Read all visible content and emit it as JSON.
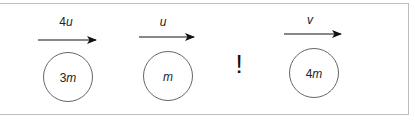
{
  "diagram": {
    "bodies": [
      {
        "mass_coeff": "3",
        "mass_var": "m",
        "velocity_coeff": "4",
        "velocity_var": "u"
      },
      {
        "mass_coeff": "",
        "mass_var": "m",
        "velocity_coeff": "",
        "velocity_var": "u"
      },
      {
        "mass_coeff": "4",
        "mass_var": "m",
        "velocity_coeff": "",
        "velocity_var": "v"
      }
    ],
    "event_symbol": "!"
  }
}
